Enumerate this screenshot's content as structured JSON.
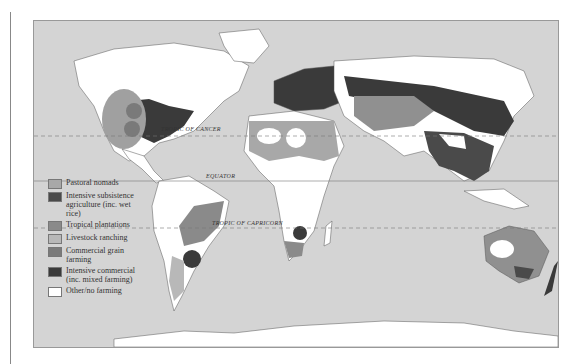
{
  "map": {
    "type": "world agricultural regions map",
    "reference_lines": {
      "tropic_of_cancer": "TROPIC OF CANCER",
      "equator": "EQUATOR",
      "tropic_of_capricorn": "TROPIC OF CAPRICORN"
    },
    "colors": {
      "ocean": "#d4d4d4",
      "pastoral_nomads": "#a8a8a8",
      "intensive_subsistence": "#4a4a4a",
      "tropical_plantations": "#8a8a8a",
      "livestock_ranching": "#b8b8b8",
      "commercial_grain": "#7a7a7a",
      "intensive_commercial": "#3a3a3a",
      "other": "#ffffff"
    }
  },
  "legend": {
    "items": [
      {
        "label": "Pastoral nomads",
        "color": "#a8a8a8"
      },
      {
        "label": "Intensive subsistence agriculture (inc. wet rice)",
        "color": "#4a4a4a"
      },
      {
        "label": "Tropical plantations",
        "color": "#8a8a8a"
      },
      {
        "label": "Livestock ranching",
        "color": "#b8b8b8"
      },
      {
        "label": "Commercial grain farming",
        "color": "#7a7a7a"
      },
      {
        "label": "Intensive commercial (inc. mixed farming)",
        "color": "#3a3a3a"
      },
      {
        "label": "Other/no farming",
        "color": "#ffffff"
      }
    ]
  }
}
